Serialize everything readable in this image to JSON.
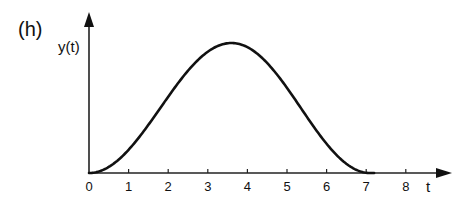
{
  "figure": {
    "panel_label": "(h)",
    "y_axis_label": "y(t)",
    "x_axis_label": "t",
    "x_ticks": [
      "0",
      "1",
      "2",
      "3",
      "4",
      "5",
      "6",
      "7",
      "8"
    ]
  },
  "chart_data": {
    "type": "line",
    "title": "(h)",
    "xlabel": "t",
    "ylabel": "y(t)",
    "xlim": [
      0,
      9
    ],
    "ylim": [
      0,
      1
    ],
    "x_ticks": [
      0,
      1,
      2,
      3,
      4,
      5,
      6,
      7,
      8
    ],
    "grid": false,
    "legend": null,
    "series": [
      {
        "name": "y(t)",
        "description": "smooth single bump starting at t=0, peaking near t=3.6, returning to 0 near t=7.1",
        "x": [
          0,
          0.5,
          1,
          1.5,
          2,
          2.5,
          3,
          3.6,
          4,
          4.5,
          5,
          5.5,
          6,
          6.5,
          7,
          7.1
        ],
        "y": [
          0,
          0.04,
          0.19,
          0.38,
          0.58,
          0.77,
          0.93,
          1.0,
          0.97,
          0.85,
          0.66,
          0.45,
          0.24,
          0.08,
          0.005,
          0
        ]
      }
    ]
  }
}
